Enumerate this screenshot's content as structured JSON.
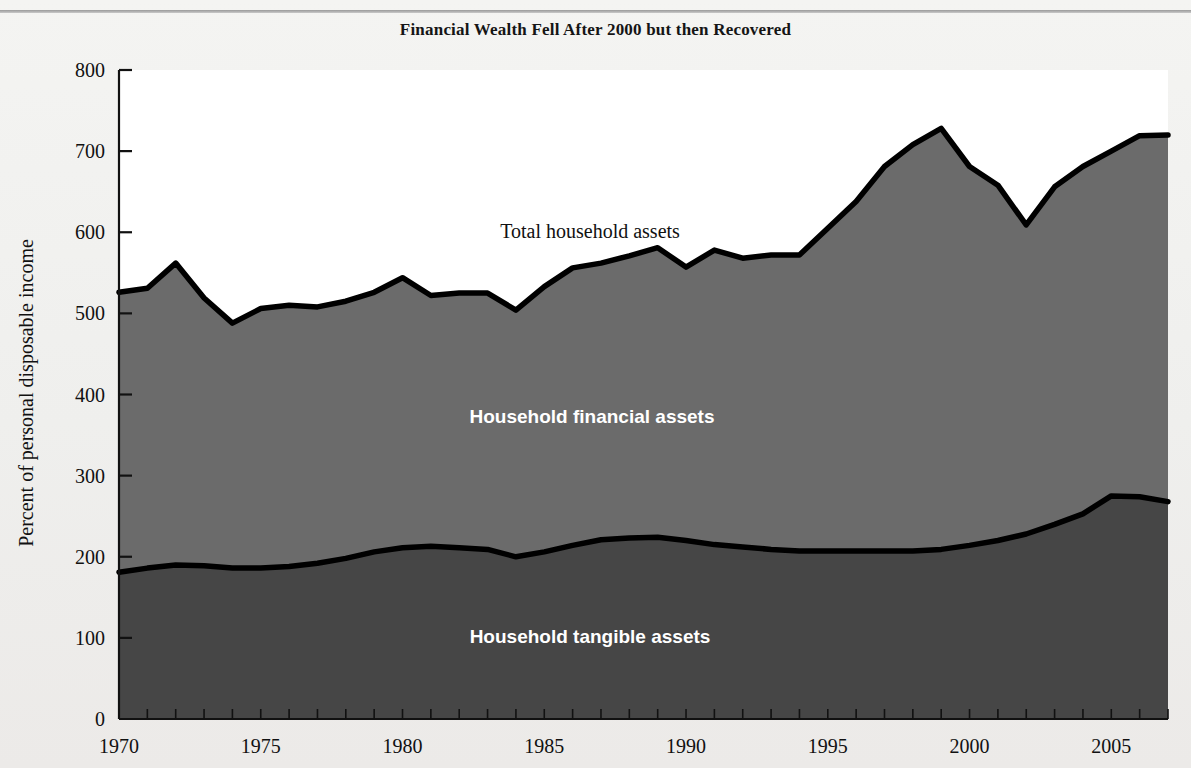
{
  "figure": {
    "title": "Financial Wealth Fell After 2000 but then Recovered",
    "ylabel": "Percent of personal disposable income",
    "background_color": "#f1f1ef",
    "line_color": "#000000"
  },
  "labels": {
    "total": "Total household assets",
    "financial": "Household financial assets",
    "tangible": "Household tangible assets"
  },
  "colors": {
    "financial_fill": "#6b6b6b",
    "tangible_fill": "#464646",
    "outline": "#000000",
    "plot_background": "#ffffff"
  },
  "chart_data": {
    "type": "area",
    "title": "Financial Wealth Fell After 2000 but then Recovered",
    "xlabel": "",
    "ylabel": "Percent of personal disposable income",
    "xlim": [
      1970,
      2007
    ],
    "ylim": [
      0,
      800
    ],
    "yticks": [
      0,
      100,
      200,
      300,
      400,
      500,
      600,
      700,
      800
    ],
    "xticks": [
      1970,
      1975,
      1980,
      1985,
      1990,
      1995,
      2000,
      2005
    ],
    "grid": false,
    "legend_position": "inline-annotations",
    "stacked": true,
    "x": [
      1970,
      1971,
      1972,
      1973,
      1974,
      1975,
      1976,
      1977,
      1978,
      1979,
      1980,
      1981,
      1982,
      1983,
      1984,
      1985,
      1986,
      1987,
      1988,
      1989,
      1990,
      1991,
      1992,
      1993,
      1994,
      1995,
      1996,
      1997,
      1998,
      1999,
      2000,
      2001,
      2002,
      2003,
      2004,
      2005,
      2006,
      2007
    ],
    "series": [
      {
        "name": "Household tangible assets",
        "values": [
          181,
          186,
          190,
          189,
          186,
          186,
          188,
          192,
          198,
          206,
          211,
          213,
          211,
          209,
          200,
          206,
          214,
          221,
          223,
          224,
          220,
          215,
          212,
          209,
          207,
          207,
          207,
          207,
          207,
          209,
          214,
          220,
          228,
          240,
          253,
          275,
          274,
          268
        ]
      },
      {
        "name": "Household financial assets",
        "values": [
          345,
          345,
          372,
          330,
          302,
          320,
          322,
          316,
          317,
          320,
          333,
          309,
          314,
          316,
          304,
          327,
          342,
          341,
          348,
          357,
          337,
          363,
          356,
          363,
          365,
          398,
          431,
          474,
          501,
          519,
          467,
          438,
          381,
          416,
          428,
          425,
          445,
          452
        ]
      }
    ],
    "total_household_assets": [
      526,
      531,
      562,
      519,
      488,
      506,
      510,
      508,
      515,
      526,
      544,
      522,
      525,
      525,
      504,
      533,
      556,
      562,
      571,
      581,
      557,
      578,
      568,
      572,
      572,
      605,
      638,
      681,
      708,
      728,
      681,
      658,
      609,
      656,
      681,
      700,
      719,
      720
    ]
  }
}
